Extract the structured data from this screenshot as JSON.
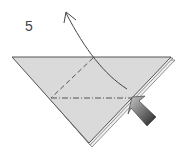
{
  "diagram": {
    "step_number": "5",
    "paper_color": "#d9d9d9",
    "edge_color": "#555555",
    "arrow_gradient": [
      "#cccccc",
      "#222222"
    ],
    "elements": [
      "valley-fold-dashed-line",
      "mountain-fold-dash-dot-line",
      "curved-fold-arrow",
      "push-arrow"
    ]
  }
}
